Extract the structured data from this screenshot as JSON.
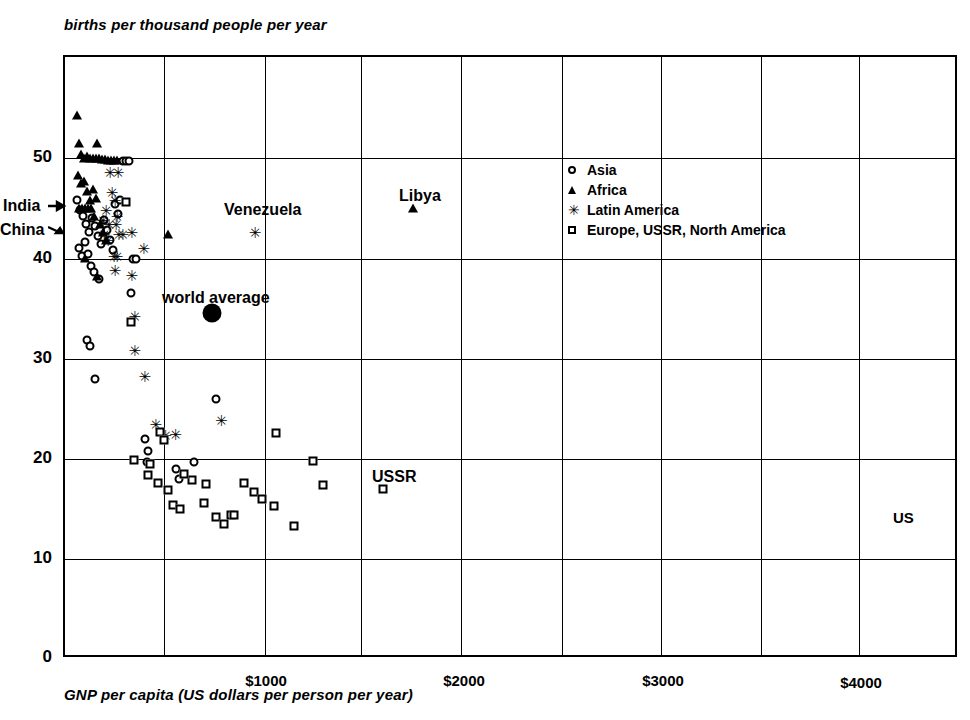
{
  "titles": {
    "y_axis": "births per thousand people per year",
    "x_axis": "GNP per capita (US dollars per person per year)"
  },
  "axes": {
    "y_ticks": [
      "0",
      "10",
      "20",
      "30",
      "40",
      "50"
    ],
    "x_ticks": [
      "$1000",
      "$2000",
      "$3000",
      "$4000"
    ]
  },
  "legend": {
    "items": [
      {
        "symbol": "circle-marker",
        "label": "Asia"
      },
      {
        "symbol": "triangle-marker",
        "label": "Africa"
      },
      {
        "symbol": "star-marker",
        "label": "Latin America"
      },
      {
        "symbol": "square-marker",
        "label": "Europe, USSR, North America"
      }
    ]
  },
  "annotations": [
    {
      "name": "india-label",
      "text": "India"
    },
    {
      "name": "china-label",
      "text": "China"
    },
    {
      "name": "venezuela-label",
      "text": "Venezuela"
    },
    {
      "name": "libya-label",
      "text": "Libya"
    },
    {
      "name": "world-average-label",
      "text": "world average"
    },
    {
      "name": "ussr-label",
      "text": "USSR"
    },
    {
      "name": "us-label",
      "text": "US"
    }
  ],
  "star_glyph": "✳",
  "chart_data": {
    "type": "scatter",
    "title": "",
    "xlabel": "GNP per capita (US dollars per person per year)",
    "ylabel": "births per thousand people per year",
    "xlim": [
      0,
      4500
    ],
    "ylim": [
      0,
      60
    ],
    "xticks": [
      1000,
      2000,
      3000,
      4000
    ],
    "yticks": [
      0,
      10,
      20,
      30,
      40,
      50
    ],
    "grid": true,
    "legend_position": "upper-right-inside",
    "series": [
      {
        "name": "Asia",
        "marker": "open-circle",
        "points": [
          [
            60,
            45.8
          ],
          [
            75,
            44.8
          ],
          [
            90,
            44.2
          ],
          [
            105,
            43.4
          ],
          [
            120,
            42.6
          ],
          [
            135,
            44.0
          ],
          [
            150,
            43.2
          ],
          [
            165,
            42.2
          ],
          [
            180,
            41.4
          ],
          [
            195,
            43.8
          ],
          [
            210,
            42.8
          ],
          [
            225,
            41.8
          ],
          [
            240,
            40.8
          ],
          [
            250,
            45.4
          ],
          [
            265,
            44.4
          ],
          [
            275,
            45.8
          ],
          [
            290,
            49.6
          ],
          [
            305,
            49.6
          ],
          [
            320,
            49.6
          ],
          [
            70,
            41.0
          ],
          [
            85,
            40.2
          ],
          [
            100,
            41.6
          ],
          [
            115,
            40.4
          ],
          [
            130,
            39.2
          ],
          [
            145,
            38.6
          ],
          [
            170,
            37.9
          ],
          [
            340,
            39.9
          ],
          [
            355,
            39.9
          ],
          [
            110,
            31.8
          ],
          [
            125,
            31.2
          ],
          [
            150,
            27.9
          ],
          [
            330,
            36.5
          ],
          [
            760,
            25.9
          ],
          [
            420,
            20.7
          ],
          [
            400,
            21.9
          ],
          [
            560,
            18.9
          ],
          [
            575,
            17.9
          ],
          [
            650,
            19.6
          ],
          [
            410,
            19.6
          ]
        ]
      },
      {
        "name": "Africa",
        "marker": "triangle",
        "points": [
          [
            60,
            54.2
          ],
          [
            70,
            51.4
          ],
          [
            80,
            50.3
          ],
          [
            95,
            49.9
          ],
          [
            110,
            50.1
          ],
          [
            125,
            49.9
          ],
          [
            140,
            49.9
          ],
          [
            155,
            49.9
          ],
          [
            170,
            49.9
          ],
          [
            185,
            49.8
          ],
          [
            200,
            49.8
          ],
          [
            215,
            49.7
          ],
          [
            230,
            49.7
          ],
          [
            245,
            49.7
          ],
          [
            260,
            49.7
          ],
          [
            160,
            51.4
          ],
          [
            65,
            48.2
          ],
          [
            80,
            47.4
          ],
          [
            95,
            47.6
          ],
          [
            110,
            46.6
          ],
          [
            125,
            45.8
          ],
          [
            140,
            46.8
          ],
          [
            155,
            46.0
          ],
          [
            70,
            45.0
          ],
          [
            85,
            45.0
          ],
          [
            100,
            45.0
          ],
          [
            115,
            45.0
          ],
          [
            130,
            45.0
          ],
          [
            145,
            44.2
          ],
          [
            175,
            43.4
          ],
          [
            190,
            42.6
          ],
          [
            205,
            41.8
          ],
          [
            100,
            40.0
          ],
          [
            160,
            38.2
          ],
          [
            520,
            42.4
          ],
          [
            1750,
            45.0
          ]
        ]
      },
      {
        "name": "Latin America",
        "marker": "star",
        "points": [
          [
            220,
            48.3
          ],
          [
            260,
            48.3
          ],
          [
            230,
            46.4
          ],
          [
            245,
            45.6
          ],
          [
            200,
            44.6
          ],
          [
            255,
            44.0
          ],
          [
            185,
            43.6
          ],
          [
            215,
            43.2
          ],
          [
            250,
            43.2
          ],
          [
            190,
            42.2
          ],
          [
            265,
            42.2
          ],
          [
            285,
            42.2
          ],
          [
            210,
            41.6
          ],
          [
            240,
            40.0
          ],
          [
            255,
            40.0
          ],
          [
            245,
            38.6
          ],
          [
            330,
            42.4
          ],
          [
            390,
            40.8
          ],
          [
            330,
            38.1
          ],
          [
            345,
            34.0
          ],
          [
            345,
            30.6
          ],
          [
            395,
            28.0
          ],
          [
            450,
            23.2
          ],
          [
            500,
            22.1
          ],
          [
            550,
            22.2
          ],
          [
            780,
            23.6
          ],
          [
            950,
            42.4
          ]
        ]
      },
      {
        "name": "Europe, USSR, North America",
        "marker": "open-square",
        "points": [
          [
            305,
            45.6
          ],
          [
            330,
            33.6
          ],
          [
            345,
            19.8
          ],
          [
            480,
            22.6
          ],
          [
            500,
            21.8
          ],
          [
            520,
            16.8
          ],
          [
            430,
            19.4
          ],
          [
            470,
            17.5
          ],
          [
            545,
            15.4
          ],
          [
            580,
            15.0
          ],
          [
            640,
            17.8
          ],
          [
            700,
            15.6
          ],
          [
            710,
            17.4
          ],
          [
            760,
            14.2
          ],
          [
            800,
            13.5
          ],
          [
            835,
            14.4
          ],
          [
            850,
            14.4
          ],
          [
            900,
            17.5
          ],
          [
            950,
            16.6
          ],
          [
            990,
            16.0
          ],
          [
            1050,
            15.3
          ],
          [
            1150,
            13.3
          ],
          [
            1300,
            17.3
          ],
          [
            1600,
            16.9
          ],
          [
            420,
            18.3
          ],
          [
            600,
            18.4
          ],
          [
            1060,
            22.5
          ],
          [
            1250,
            19.7
          ]
        ]
      },
      {
        "name": "world average",
        "marker": "filled-dot",
        "points": [
          [
            740,
            34.5
          ]
        ]
      }
    ],
    "point_labels": [
      {
        "label": "India",
        "x": 0,
        "y": 45.8
      },
      {
        "label": "China",
        "x": 0,
        "y": 43.2
      },
      {
        "label": "Venezuela",
        "x": 950,
        "y": 42.4
      },
      {
        "label": "Libya",
        "x": 1750,
        "y": 45.0
      },
      {
        "label": "USSR",
        "x": 1250,
        "y": 19.7
      },
      {
        "label": "US",
        "x": 4350,
        "y": 17.0
      }
    ]
  }
}
